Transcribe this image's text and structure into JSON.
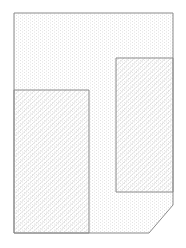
{
  "page": {
    "background_color": "#ffffff",
    "width": 186,
    "height": 248
  },
  "diagram": {
    "stroke_color": "#8a8a8a",
    "stroke_width": 1,
    "patterns": {
      "dots": {
        "name": "stipple-dot-fill",
        "dot_color": "#e2e2e2",
        "tile_width": 4,
        "tile_height": 3
      },
      "hatch": {
        "name": "diagonal-hatch-fill",
        "line_color": "#d9d9d9",
        "line_width": 0.8,
        "spacing": 5.2,
        "direction": "forward-slash"
      }
    },
    "shapes": [
      {
        "name": "outer-region",
        "type": "polygon",
        "fill_pattern": "dots",
        "points": [
          [
            14,
            13
          ],
          [
            173,
            13
          ],
          [
            173,
            205
          ],
          [
            149,
            233
          ],
          [
            14,
            233
          ]
        ]
      },
      {
        "name": "left-hatched-block",
        "type": "polygon",
        "fill_pattern": "hatch",
        "points": [
          [
            14,
            90
          ],
          [
            89,
            90
          ],
          [
            89,
            233
          ],
          [
            14,
            233
          ]
        ]
      },
      {
        "name": "right-hatched-block",
        "type": "polygon",
        "fill_pattern": "hatch",
        "points": [
          [
            116,
            58
          ],
          [
            173,
            58
          ],
          [
            173,
            192
          ],
          [
            116,
            192
          ]
        ]
      }
    ]
  }
}
